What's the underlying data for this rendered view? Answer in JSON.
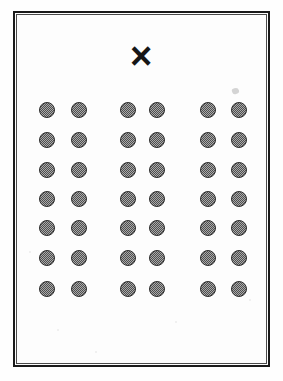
{
  "page": {
    "background_color": "#fefefe",
    "width": 283,
    "height": 381
  },
  "frame": {
    "name": "printed border frame",
    "stroke_color": "#1a1a1a",
    "stroke_width": 2,
    "left": 13,
    "top": 11,
    "width": 257,
    "height": 356
  },
  "mark": {
    "glyph": "×",
    "label": "X",
    "color": "#161616",
    "left": 120,
    "top": 36,
    "size": 38
  },
  "artifacts": {
    "smudge_label": "",
    "speckles": [
      {
        "x": 58,
        "y": 330,
        "r": 1.2
      },
      {
        "x": 176,
        "y": 322,
        "r": 1.0
      },
      {
        "x": 96,
        "y": 352,
        "r": 1.0
      },
      {
        "x": 214,
        "y": 200,
        "r": 1.0
      },
      {
        "x": 30,
        "y": 252,
        "r": 1.1
      },
      {
        "x": 250,
        "y": 300,
        "r": 1.0
      }
    ]
  },
  "dot_grid": {
    "rows": 7,
    "columns": 6,
    "groups": 3,
    "columns_per_group": 2,
    "total_dots": 42,
    "dot_diameter": 16,
    "fill_color": "#6f6f6f",
    "outline_color": "#2e2e2e",
    "column_centers_x": [
      47,
      79,
      128,
      157,
      208,
      239
    ],
    "row_centers_y": [
      110,
      140,
      170,
      199,
      228,
      258,
      289
    ]
  },
  "chart_data": {
    "type": "scatter",
    "xlabel": "",
    "ylabel": "",
    "xlim": [
      0,
      283
    ],
    "ylim": [
      0,
      381
    ],
    "grid": false,
    "legend": "none",
    "series": [
      {
        "name": "dots",
        "marker": "filled-circle-stippled",
        "x": [
          47,
          79,
          128,
          157,
          208,
          239,
          47,
          79,
          128,
          157,
          208,
          239,
          47,
          79,
          128,
          157,
          208,
          239,
          47,
          79,
          128,
          157,
          208,
          239,
          47,
          79,
          128,
          157,
          208,
          239,
          47,
          79,
          128,
          157,
          208,
          239,
          47,
          79,
          128,
          157,
          208,
          239
        ],
        "y": [
          110,
          110,
          110,
          110,
          110,
          110,
          140,
          140,
          140,
          140,
          140,
          140,
          170,
          170,
          170,
          170,
          170,
          170,
          199,
          199,
          199,
          199,
          199,
          199,
          228,
          228,
          228,
          228,
          228,
          228,
          258,
          258,
          258,
          258,
          258,
          258,
          289,
          289,
          289,
          289,
          289,
          289
        ]
      }
    ],
    "annotations": [
      {
        "text": "×",
        "x": 141,
        "y": 56,
        "label": "X mark"
      }
    ]
  }
}
